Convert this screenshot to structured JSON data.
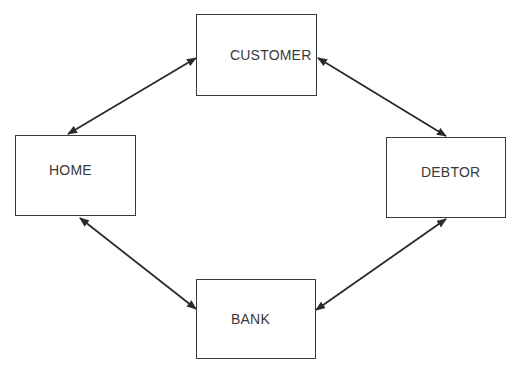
{
  "diagram": {
    "type": "flow",
    "nodes": [
      {
        "id": "customer",
        "label": "CUSTOMER",
        "x": 196,
        "y": 14,
        "w": 121,
        "h": 82,
        "label_x": 34,
        "label_y": 32
      },
      {
        "id": "home",
        "label": "HOME",
        "x": 15,
        "y": 135,
        "w": 121,
        "h": 81,
        "label_x": 33,
        "label_y": 27
      },
      {
        "id": "debtor",
        "label": "DEBTOR",
        "x": 386,
        "y": 137,
        "w": 120,
        "h": 81,
        "label_x": 34,
        "label_y": 27
      },
      {
        "id": "bank",
        "label": "BANK",
        "x": 196,
        "y": 279,
        "w": 120,
        "h": 80,
        "label_x": 34,
        "label_y": 32
      }
    ],
    "edges": [
      {
        "from": "customer",
        "to": "home",
        "bidirectional": true
      },
      {
        "from": "customer",
        "to": "debtor",
        "bidirectional": true
      },
      {
        "from": "home",
        "to": "bank",
        "bidirectional": true
      },
      {
        "from": "debtor",
        "to": "bank",
        "bidirectional": true
      }
    ],
    "line_color": "#2a2a2a"
  }
}
